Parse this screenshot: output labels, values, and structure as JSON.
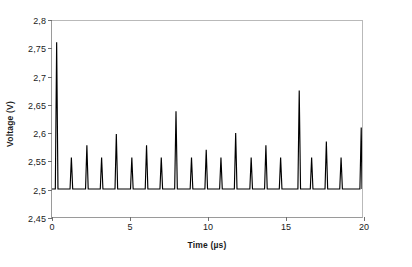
{
  "chart_data": {
    "type": "line",
    "title": "",
    "xlabel": "Time (µs)",
    "ylabel": "Voltage (V)",
    "xlim": [
      0,
      20
    ],
    "ylim": [
      2.45,
      2.8
    ],
    "grid": false,
    "legend": null,
    "xticks": [
      0,
      5,
      10,
      15,
      20
    ],
    "xtick_labels": [
      "0",
      "5",
      "10",
      "15",
      "20"
    ],
    "yticks": [
      2.45,
      2.5,
      2.55,
      2.6,
      2.65,
      2.7,
      2.75,
      2.8
    ],
    "ytick_labels": [
      "2,45",
      "2,5",
      "2,55",
      "2,6",
      "2,65",
      "2,7",
      "2,75",
      "2,8"
    ],
    "decimal_separator": ",",
    "series_color": "#000000",
    "axis_color": "#9a9a9a",
    "baseline": 2.5,
    "peaks": [
      {
        "x": 0.3,
        "y": 2.762
      },
      {
        "x": 1.25,
        "y": 2.556
      },
      {
        "x": 2.25,
        "y": 2.578
      },
      {
        "x": 3.2,
        "y": 2.556
      },
      {
        "x": 4.15,
        "y": 2.598
      },
      {
        "x": 5.15,
        "y": 2.556
      },
      {
        "x": 6.1,
        "y": 2.578
      },
      {
        "x": 7.05,
        "y": 2.556
      },
      {
        "x": 8.0,
        "y": 2.639
      },
      {
        "x": 9.0,
        "y": 2.556
      },
      {
        "x": 9.95,
        "y": 2.57
      },
      {
        "x": 10.9,
        "y": 2.556
      },
      {
        "x": 11.85,
        "y": 2.6
      },
      {
        "x": 12.85,
        "y": 2.556
      },
      {
        "x": 13.8,
        "y": 2.578
      },
      {
        "x": 14.75,
        "y": 2.556
      },
      {
        "x": 15.95,
        "y": 2.676
      },
      {
        "x": 16.75,
        "y": 2.556
      },
      {
        "x": 17.7,
        "y": 2.585
      },
      {
        "x": 18.65,
        "y": 2.556
      },
      {
        "x": 19.95,
        "y": 2.61
      }
    ],
    "peak_half_width": 0.085
  }
}
